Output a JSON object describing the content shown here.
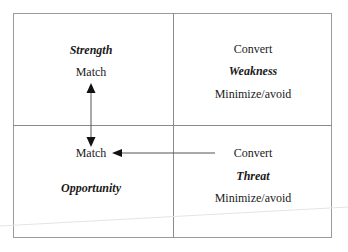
{
  "diagram": {
    "type": "swot-conversion-matrix",
    "quadrants": {
      "top_left": {
        "title": "Strength",
        "action": "Match"
      },
      "top_right": {
        "action_top": "Convert",
        "title": "Weakness",
        "action_bottom": "Minimize/avoid"
      },
      "bottom_left": {
        "action": "Match",
        "title": "Opportunity"
      },
      "bottom_right": {
        "action_top": "Convert",
        "title": "Threat",
        "action_bottom": "Minimize/avoid"
      }
    },
    "arrows": [
      {
        "from": "Strength Match",
        "to": "Opportunity Match",
        "style": "double-headed",
        "orientation": "vertical"
      },
      {
        "from": "Threat Convert",
        "to": "Opportunity Match",
        "style": "single-headed",
        "orientation": "horizontal"
      }
    ],
    "colors": {
      "border": "#9a9a9a",
      "divider": "#8a8a8a",
      "arrow": "#111111",
      "text": "#1a1a1a"
    }
  }
}
